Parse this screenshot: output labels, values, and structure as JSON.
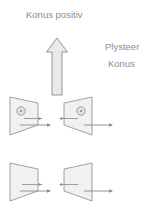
{
  "canvas": {
    "width": 150,
    "height": 218,
    "background": "#ffffff"
  },
  "palette": {
    "text": "#8d8d8d",
    "stroke": "#8a8a8a",
    "shape_fill": "#f1f1f1",
    "arrow_fill": "#e9e9e9",
    "hole_fill": "#e2e2e2"
  },
  "labels": {
    "title": "Konus positiv",
    "legend_line1": "Plysteer",
    "legend_line2": "Konus"
  },
  "diagram": {
    "type": "engineering-cone-diagram",
    "main_arrow": {
      "name": "up-arrow",
      "direction": "up",
      "x": 57,
      "y_top": 38,
      "y_bottom": 95
    },
    "rows": [
      {
        "name": "row-top",
        "has_holes": true,
        "shapes": [
          {
            "name": "cone-top-left",
            "orientation": "wide-left",
            "has_hole": true,
            "vectors": [
              "inward-short",
              "outward-long"
            ]
          },
          {
            "name": "cone-top-right",
            "orientation": "wide-right",
            "has_hole": true,
            "vectors": [
              "inward-short",
              "outward-long"
            ]
          }
        ]
      },
      {
        "name": "row-bottom",
        "has_holes": false,
        "shapes": [
          {
            "name": "cone-bottom-left",
            "orientation": "wide-left",
            "has_hole": false,
            "vectors": [
              "inward-short",
              "outward-long"
            ]
          },
          {
            "name": "cone-bottom-right",
            "orientation": "wide-right",
            "has_hole": false,
            "vectors": [
              "inward-short",
              "outward-long"
            ]
          }
        ]
      }
    ]
  }
}
